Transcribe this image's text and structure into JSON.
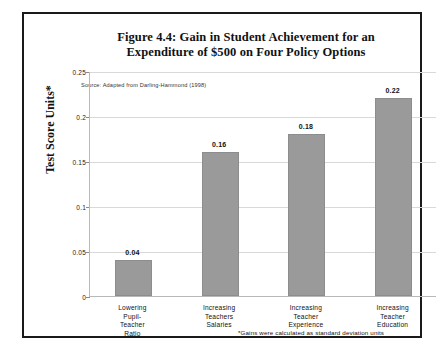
{
  "figure": {
    "title_line1": "Figure 4.4: Gain in Student Achievement for an",
    "title_line2": "Expenditure of $500 on Four Policy Options",
    "source_note": "Source:  Adapted from Darling-Hammond (1998)",
    "footnote": "*Gains were calculated as standard deviation units",
    "frame_color": "#1a1a1a"
  },
  "chart_data": {
    "type": "bar",
    "title": "Figure 4.4: Gain in Student Achievement for an Expenditure of $500 on Four Policy Options",
    "categories": [
      "Lowering Pupil-Teacher Ratio",
      "Increasing Teachers Salaries",
      "Increasing Teacher Experience",
      "Increasing Teacher Education"
    ],
    "category_lines": [
      [
        "Lowering",
        "Pupil-",
        "Teacher",
        "Ratio"
      ],
      [
        "Increasing",
        "Teachers",
        "Salaries"
      ],
      [
        "Increasing",
        "Teacher",
        "Experience"
      ],
      [
        "Increasing",
        "Teacher",
        "Education"
      ]
    ],
    "values": [
      0.04,
      0.16,
      0.18,
      0.22
    ],
    "value_labels": [
      "0.04",
      "0.16",
      "0.18",
      "0.22"
    ],
    "xlabel": "",
    "ylabel": "Test Score Units*",
    "ylim": [
      0,
      0.25
    ],
    "yticks": [
      0.25,
      0.2,
      0.15,
      0.1,
      0.05,
      0
    ],
    "ytick_labels": [
      "0.25",
      "0.2",
      "0.15",
      "0.1",
      "0.05",
      "0"
    ],
    "grid": true,
    "legend": false,
    "bar_color": "#9a9a9a",
    "gridline_color": "#d9d9d9",
    "axis_color": "#b9b9b9"
  }
}
